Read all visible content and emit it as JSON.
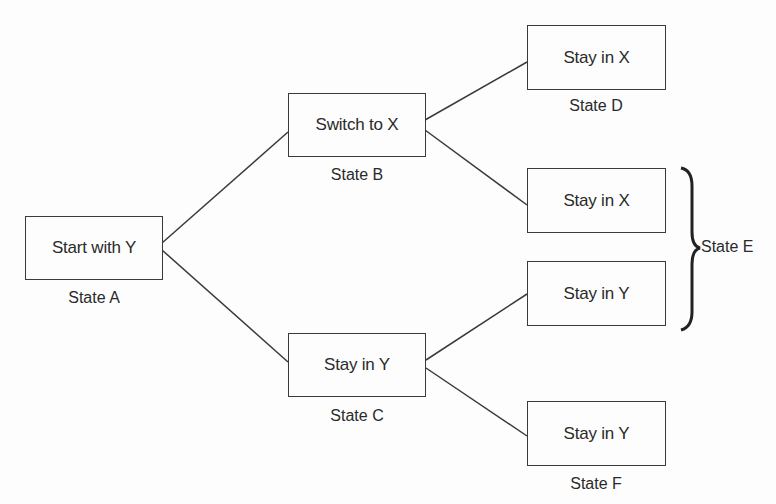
{
  "diagram": {
    "type": "state-tree",
    "nodes": [
      {
        "id": "A",
        "text": "Start with Y",
        "caption": "State A"
      },
      {
        "id": "B",
        "text": "Switch to X",
        "caption": "State B"
      },
      {
        "id": "C",
        "text": "Stay in Y",
        "caption": "State C"
      },
      {
        "id": "D",
        "text": "Stay in X",
        "caption": "State D"
      },
      {
        "id": "E1",
        "text": "Stay in X",
        "caption": ""
      },
      {
        "id": "E2",
        "text": "Stay in Y",
        "caption": ""
      },
      {
        "id": "F",
        "text": "Stay in Y",
        "caption": "State F"
      }
    ],
    "edges": [
      {
        "from": "A",
        "to": "B"
      },
      {
        "from": "A",
        "to": "C"
      },
      {
        "from": "B",
        "to": "D"
      },
      {
        "from": "B",
        "to": "E1"
      },
      {
        "from": "C",
        "to": "E2"
      },
      {
        "from": "C",
        "to": "F"
      }
    ],
    "group": {
      "members": [
        "E1",
        "E2"
      ],
      "caption": "State E"
    }
  }
}
